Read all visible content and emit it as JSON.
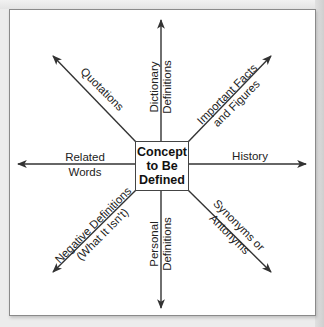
{
  "diagram": {
    "center": {
      "line1": "Concept",
      "line2": "to Be",
      "line3": "Defined"
    },
    "branches": {
      "up": {
        "line1": "Dictionary",
        "line2": "Definitions"
      },
      "upper_right": {
        "line1": "Important Facts",
        "line2": "and Figures"
      },
      "right": {
        "line1": "History"
      },
      "lower_right": {
        "line1": "Synonyms or",
        "line2": "Antonyms"
      },
      "down": {
        "line1": "Personal",
        "line2": "Definitions"
      },
      "lower_left": {
        "line1": "Negative Definitions",
        "line2": "(What It Isn't)"
      },
      "left": {
        "line1": "Related",
        "line2": "Words"
      },
      "upper_left": {
        "line1": "Quotations"
      }
    },
    "colors": {
      "arrow": "#333333",
      "frame_border": "#8a8a8a",
      "background": "#ffffff",
      "page": "#ececec"
    }
  }
}
